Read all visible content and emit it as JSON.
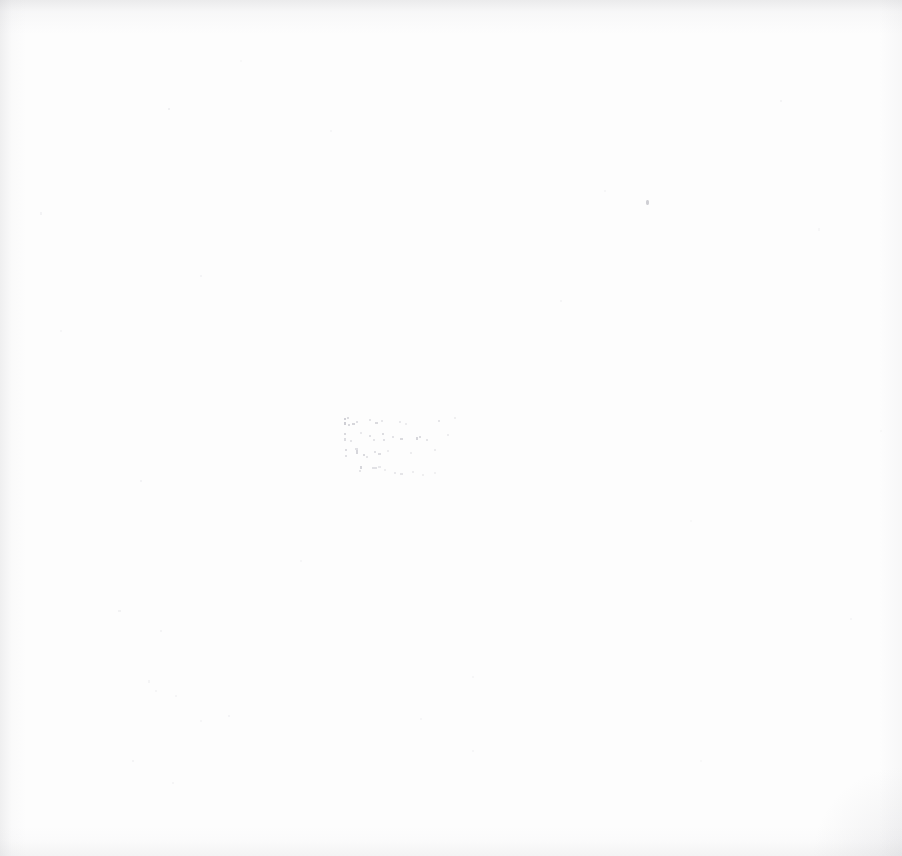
{
  "page": {
    "kind": "scanned-blank-page",
    "width": 902,
    "height": 856,
    "background_color": "#fdfdfd",
    "edge_shadow_color": "#aaaaaf"
  },
  "faded_text_block": {
    "left": 344,
    "top": 416,
    "line_count": 4,
    "ink_color": "#6a6a78",
    "legible": false,
    "note": "Ink has faded to the noise floor; no glyphs are resolvable at any magnification.",
    "lines": [
      {
        "text": "",
        "illegible": true,
        "width_px": 100,
        "indent_px": 0
      },
      {
        "text": "",
        "illegible": true,
        "width_px": 112,
        "indent_px": 1
      },
      {
        "text": "",
        "illegible": true,
        "width_px": 96,
        "indent_px": 2
      },
      {
        "text": "",
        "illegible": true,
        "width_px": 80,
        "indent_px": 14
      }
    ]
  },
  "artifacts": {
    "dust_mote": {
      "x": 646,
      "y": 200,
      "color": "#78788 7"
    }
  }
}
